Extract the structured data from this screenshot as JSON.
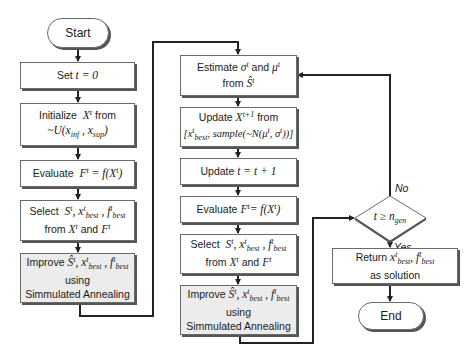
{
  "diagram": {
    "type": "flowchart",
    "left_column": {
      "start": "Start",
      "set_t": "Set t = 0",
      "initialize": {
        "line1": "Initialize X^t from",
        "line2": "~U(x_inf , x_sup)"
      },
      "evaluate": "Evaluate F^t = f(X^t)",
      "select": {
        "line1": "Select S^t, x^t_best , f^t_best",
        "line2": "from X^t and F^t"
      },
      "improve": {
        "line1": "Improve Ŝ^t, x^t_best , f^t_best",
        "line2": "using",
        "line3": "Simmulated Annealing"
      }
    },
    "right_column": {
      "estimate": {
        "line1": "Estimate σ^t and μ^t",
        "line2": "from Ŝ^t"
      },
      "update_x": {
        "line1": "Update X^(t+1) from",
        "line2": "[x^t_best, sample(~N(μ^t, σ^t))]"
      },
      "update_t": "Update t = t + 1",
      "evaluate": "Evaluate F^t = f(X^t)",
      "select": {
        "line1": "Select S^t, x^t_best , f^t_best",
        "line2": "from X^t and F^t"
      },
      "improve": {
        "line1": "Improve Ŝ^t, x^t_best , f^t_best",
        "line2": "using",
        "line3": "Simmulated Annealing"
      }
    },
    "decision": {
      "condition": "t ≥ n_gen",
      "no_label": "No",
      "yes_label": "Yes"
    },
    "terminal": {
      "return": {
        "line1": "Return x^t_best, f^t_best",
        "line2": "as solution"
      },
      "end": "End"
    },
    "labels": {
      "start": "Start",
      "end": "End",
      "no": "No",
      "yes": "Yes",
      "using": "using",
      "sa": "Simmulated Annealing",
      "as_solution": "as solution",
      "from": "from",
      "and": "and",
      "select": "Select",
      "improve": "Improve",
      "evaluate": "Evaluate",
      "estimate": "Estimate",
      "update": "Update",
      "initialize": "Initialize",
      "return": "Return",
      "set": "Set"
    }
  }
}
